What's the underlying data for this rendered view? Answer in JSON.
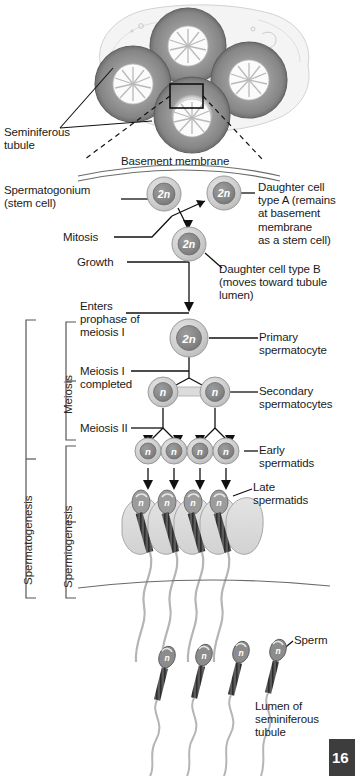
{
  "figure": {
    "page_number": "16"
  },
  "labels": {
    "seminiferous_tubule": "Seminiferous\ntubule",
    "basement_membrane": "Basement membrane",
    "spermatogonium": "Spermatogonium\n(stem cell)",
    "daughter_cell_a": "Daughter cell\ntype A (remains\nat basement\nmembrane\nas a stem cell)",
    "mitosis": "Mitosis",
    "growth": "Growth",
    "daughter_cell_b": "Daughter cell type B\n(moves toward tubule\nlumen)",
    "enters_prophase": "Enters\nprophase of\nmeiosis I",
    "primary_spermatocyte": "Primary\nspermatocyte",
    "meiosis_i_completed": "Meiosis I\ncompleted",
    "secondary_spermatocytes": "Secondary\nspermatocytes",
    "meiosis_ii": "Meiosis II",
    "early_spermatids": "Early\nspermatids",
    "late_spermatids": "Late\nspermatids",
    "sperm": "Sperm",
    "lumen": "Lumen of\nseminiferous\ntubule"
  },
  "brackets": {
    "spermatogenesis": "Spermatogenesis",
    "meiosis": "Meiosis",
    "spermiogenesis": "Spermiogenesis"
  },
  "cells": {
    "ploidy_diploid": "2n",
    "ploidy_haploid": "n",
    "spermatogonium_stem": "2n",
    "daughter_a": "2n",
    "daughter_b": "2n",
    "primary_spermatocyte": "2n",
    "secondary_spermatocyte_left": "n",
    "secondary_spermatocyte_right": "n",
    "early_spermatid_1": "n",
    "early_spermatid_2": "n",
    "early_spermatid_3": "n",
    "early_spermatid_4": "n",
    "late_spermatid_1": "n",
    "late_spermatid_2": "n",
    "late_spermatid_3": "n",
    "late_spermatid_4": "n",
    "sperm_1": "n",
    "sperm_2": "n",
    "sperm_3": "n",
    "sperm_4": "n"
  },
  "colors": {
    "cell_outer": "#cfcfcf",
    "cell_nucleus": "#888888",
    "nucleus_text": "#ffffff",
    "line": "#1a1a1a",
    "bracket": "#555555",
    "tubule_fill": "#b8b8b8",
    "cytoplasm": "#d8d8d8",
    "badge_bg": "#3d3d3d",
    "background": "#ffffff"
  }
}
